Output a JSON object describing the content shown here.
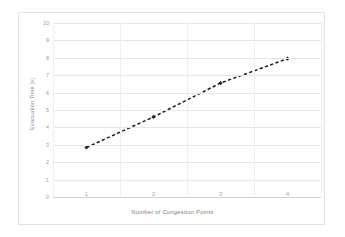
{
  "chart_data": {
    "type": "line",
    "title": "",
    "xlabel": "Number of Congestion Points",
    "ylabel": "Evacuation Time [s]",
    "x": [
      1,
      2,
      3,
      4
    ],
    "categories": [
      "1",
      "2",
      "3",
      "4"
    ],
    "values": [
      2.85,
      4.6,
      6.55,
      7.95
    ],
    "series": [
      {
        "name": "Evacuation Time",
        "values": [
          2.85,
          4.6,
          6.55,
          7.95
        ]
      }
    ],
    "xlim": [
      0.5,
      4.5
    ],
    "ylim": [
      0,
      10
    ],
    "y_ticks": [
      0,
      1,
      2,
      3,
      4,
      5,
      6,
      7,
      8,
      9,
      10
    ],
    "y_tick_labels": [
      "0",
      "1",
      "2",
      "3",
      "4",
      "5",
      "6",
      "7",
      "8",
      "9",
      "10"
    ],
    "x_tick_labels": [
      "1",
      "2",
      "3",
      "4"
    ],
    "grid": {
      "horizontal": true,
      "vertical": true
    },
    "legend": {
      "visible": false,
      "position": "none"
    },
    "style": {
      "line_color": "#1a1a1a",
      "line_dash": "dashed",
      "marker_color": "#262626",
      "marker_shape": "diamond",
      "gridline_color": "#e6e6e6",
      "axis_color": "#d2d2d2",
      "tick_label_color": "#9a9a9a",
      "axis_title_color": "#7d7d7d",
      "background_color": "#ffffff",
      "border_color": "#e2e2e2"
    }
  }
}
